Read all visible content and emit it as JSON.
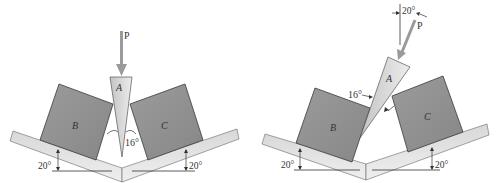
{
  "figure": {
    "left": {
      "force_label": "P",
      "wedge_label": "A",
      "block_left_label": "B",
      "block_right_label": "C",
      "wedge_angle": "16°",
      "incline_left_angle": "20°",
      "incline_right_angle": "20°"
    },
    "right": {
      "force_label": "P",
      "force_angle": "20°",
      "wedge_label": "A",
      "block_left_label": "B",
      "block_right_label": "C",
      "wedge_angle": "16°",
      "incline_left_angle": "20°",
      "incline_right_angle": "20°"
    }
  },
  "colors": {
    "block": "#8f8f8f",
    "block_edge": "#3a3a3a",
    "wedge": "#d6d6d6",
    "ground": "#c8c8c8",
    "arrow": "#9a9a9a",
    "line": "#333333"
  }
}
